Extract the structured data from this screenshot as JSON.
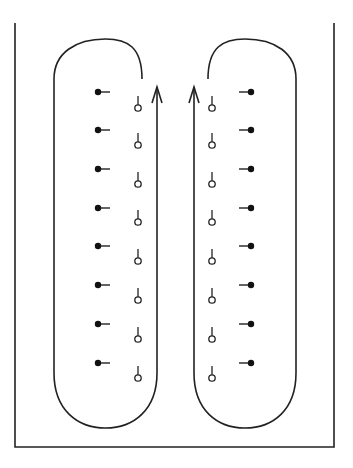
{
  "diagram": {
    "stroke_color": "#222222",
    "background": "#ffffff",
    "enclosure": {
      "left_x": 15,
      "right_x": 334,
      "top_y": 23,
      "bottom_y": 447
    },
    "loops": [
      {
        "name": "left-loop",
        "outer_x": 54,
        "inner_x": 157,
        "arc_end_x": 142,
        "arc_end_y": 79,
        "top_y": 39,
        "bottom_y": 428,
        "arrow_tip_y": 87,
        "filled_dots": {
          "x": 98,
          "tick_dir": "right",
          "ys": [
            92,
            130,
            169,
            208,
            246,
            285,
            324,
            363
          ]
        },
        "open_circles": {
          "x": 138,
          "ys": [
            108,
            145,
            184,
            222,
            261,
            300,
            339,
            378
          ]
        }
      },
      {
        "name": "right-loop",
        "outer_x": 296,
        "inner_x": 194,
        "arc_end_x": 208,
        "arc_end_y": 79,
        "top_y": 39,
        "bottom_y": 428,
        "arrow_tip_y": 87,
        "filled_dots": {
          "x": 251,
          "tick_dir": "left",
          "ys": [
            92,
            130,
            169,
            208,
            246,
            285,
            324,
            363
          ]
        },
        "open_circles": {
          "x": 212,
          "ys": [
            108,
            145,
            184,
            222,
            261,
            300,
            339,
            378
          ]
        }
      }
    ]
  }
}
